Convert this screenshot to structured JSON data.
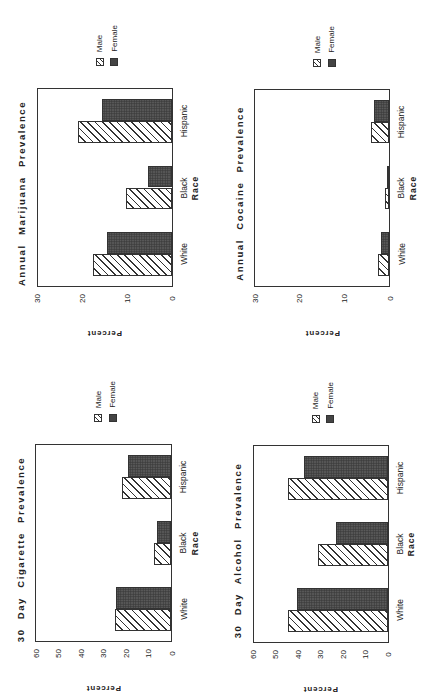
{
  "page": {
    "orientation": "rotated-90-ccw",
    "legend": {
      "male_label": "Male",
      "female_label": "Female"
    },
    "x_axis_label": "Race",
    "y_axis_label": "Percent"
  },
  "colors": {
    "male_pattern": "#ffffff",
    "hatch": "#333333",
    "female_fill": "#4a4a4a",
    "axis": "#333333"
  },
  "chart_data": [
    {
      "id": "marijuana",
      "type": "bar",
      "title": "Annual Marijuana Prevalence",
      "xlabel": "Race",
      "ylabel": "Percent",
      "categories": [
        "White",
        "Black",
        "Hispanic"
      ],
      "series": [
        {
          "name": "Male",
          "values": [
            17.7,
            10.3,
            20.9
          ]
        },
        {
          "name": "Female",
          "values": [
            14.6,
            5.3,
            15.7
          ]
        }
      ],
      "ylim": [
        0,
        30
      ],
      "yticks": [
        0,
        10,
        20,
        30
      ],
      "grid": false,
      "legend_position": "right",
      "layout": {
        "left": 36.5,
        "top": 88,
        "right": 172.5,
        "bottom": 287
      }
    },
    {
      "id": "cocaine",
      "type": "bar",
      "title": "Annual Cocaine Prevalence",
      "xlabel": "Race",
      "ylabel": "Percent",
      "categories": [
        "White",
        "Black",
        "Hispanic"
      ],
      "series": [
        {
          "name": "Male",
          "values": [
            2.5,
            1.0,
            4.1
          ]
        },
        {
          "name": "Female",
          "values": [
            1.9,
            0.6,
            3.4
          ]
        }
      ],
      "ylim": [
        0,
        30
      ],
      "yticks": [
        0,
        10,
        20,
        30
      ],
      "grid": false,
      "legend_position": "right",
      "layout": {
        "left": 254,
        "top": 88.5,
        "right": 390,
        "bottom": 287
      }
    },
    {
      "id": "cigarette",
      "type": "bar",
      "title": "30 Day Cigarette Prevalence",
      "xlabel": "Race",
      "ylabel": "Percent",
      "categories": [
        "White",
        "Black",
        "Hispanic"
      ],
      "series": [
        {
          "name": "Male",
          "values": [
            25.1,
            7.6,
            22.0
          ]
        },
        {
          "name": "Female",
          "values": [
            24.5,
            6.6,
            19.1
          ]
        }
      ],
      "ylim": [
        0,
        60
      ],
      "yticks": [
        0,
        10,
        20,
        30,
        40,
        50,
        60
      ],
      "grid": false,
      "legend_position": "right",
      "layout": {
        "left": 35,
        "top": 444,
        "right": 172,
        "bottom": 642
      }
    },
    {
      "id": "alcohol",
      "type": "bar",
      "title": "30 Day Alcohol Prevalence",
      "xlabel": "Race",
      "ylabel": "Percent",
      "categories": [
        "White",
        "Black",
        "Hispanic"
      ],
      "series": [
        {
          "name": "Male",
          "values": [
            44.7,
            31.4,
            44.7
          ]
        },
        {
          "name": "Female",
          "values": [
            40.7,
            23.2,
            37.5
          ]
        }
      ],
      "ylim": [
        0,
        60
      ],
      "yticks": [
        0,
        10,
        20,
        30,
        40,
        50,
        60
      ],
      "grid": false,
      "legend_position": "right",
      "layout": {
        "left": 252.5,
        "top": 445,
        "right": 388.5,
        "bottom": 643
      }
    }
  ]
}
